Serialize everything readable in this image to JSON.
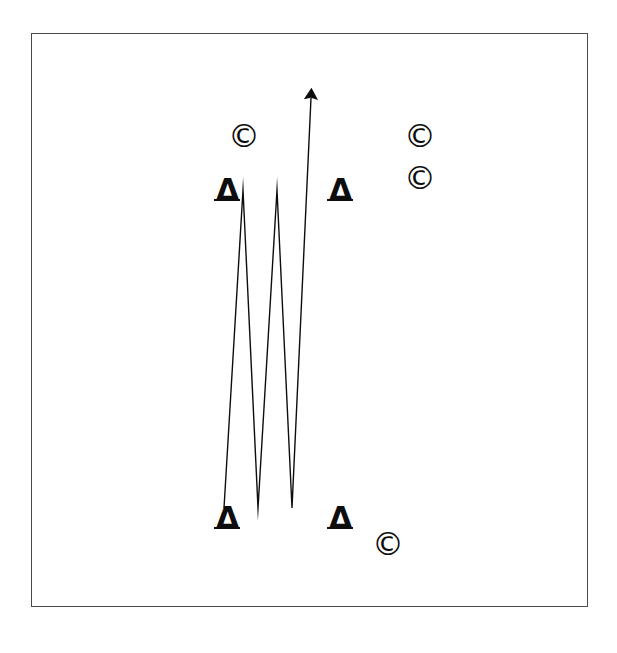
{
  "figure": {
    "background_color": "#ffffff",
    "ink_color": "#0d0d0d",
    "frame": {
      "name": "figure-border",
      "x": 31,
      "y": 33,
      "width": 557,
      "height": 574,
      "border_color": "#4a4a4a",
      "border_width": 1.5
    }
  },
  "chart_data": {
    "type": "line",
    "xlabel": "",
    "ylabel": "",
    "grid": false,
    "legend": null,
    "xlim": [
      31,
      588
    ],
    "ylim": [
      607,
      33
    ],
    "series": [
      {
        "name": "zigzag-arrow-path",
        "stroke_color": "#0d0d0d",
        "stroke_width": 1.4,
        "arrowhead": "end",
        "points": [
          {
            "x": 224,
            "y": 508,
            "role": "start"
          },
          {
            "x": 243,
            "y": 190,
            "role": "peak"
          },
          {
            "x": 258,
            "y": 508,
            "role": "valley"
          },
          {
            "x": 277,
            "y": 190,
            "role": "peak"
          },
          {
            "x": 292,
            "y": 508,
            "role": "valley"
          },
          {
            "x": 311,
            "y": 98,
            "role": "arrow-tip"
          }
        ]
      }
    ],
    "annotations": [
      {
        "id": "triangle-top-left",
        "symbol": "triangle",
        "text": "Δ",
        "x": 216,
        "y": 175,
        "size": 30
      },
      {
        "id": "triangle-top-right",
        "symbol": "triangle",
        "text": "Δ",
        "x": 329,
        "y": 175,
        "size": 30
      },
      {
        "id": "triangle-bottom-left",
        "symbol": "triangle",
        "text": "Δ",
        "x": 216,
        "y": 503,
        "size": 30
      },
      {
        "id": "triangle-bottom-right",
        "symbol": "triangle",
        "text": "Δ",
        "x": 329,
        "y": 503,
        "size": 30
      },
      {
        "id": "copyright-upper-left",
        "symbol": "copyright",
        "text": "©",
        "x": 228,
        "y": 120,
        "size": 32
      },
      {
        "id": "copyright-right-upper",
        "symbol": "copyright",
        "text": "©",
        "x": 404,
        "y": 120,
        "size": 32
      },
      {
        "id": "copyright-right-lower",
        "symbol": "copyright",
        "text": "©",
        "x": 404,
        "y": 162,
        "size": 32
      },
      {
        "id": "copyright-bottom",
        "symbol": "copyright",
        "text": "©",
        "x": 372,
        "y": 528,
        "size": 32
      }
    ]
  }
}
